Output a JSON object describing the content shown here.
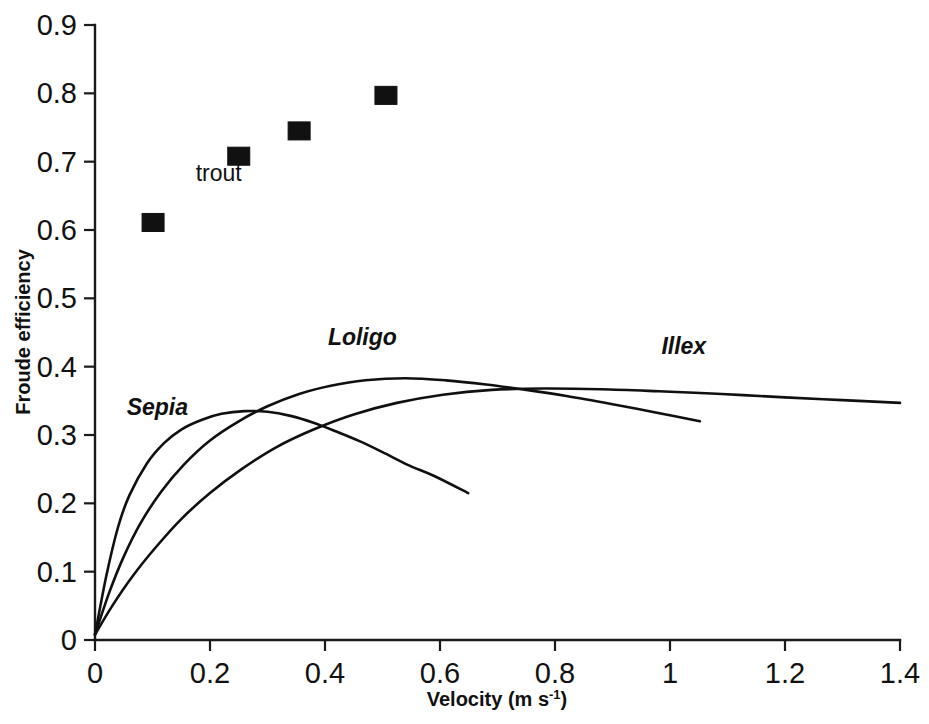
{
  "chart_data": {
    "type": "line",
    "title": "",
    "xlabel": "Velocity (m s-1)",
    "xlabel_base": "Velocity (m s",
    "xlabel_sup": "-1",
    "xlabel_tail": ")",
    "ylabel": "Froude efficiency",
    "xlim": [
      0,
      1.4
    ],
    "ylim": [
      0,
      0.9
    ],
    "xticks": [
      0,
      0.2,
      0.4,
      0.6,
      0.8,
      1,
      1.2,
      1.4
    ],
    "xticklabels": [
      "0",
      "0.2",
      "0.4",
      "0.6",
      "0.8",
      "1",
      "1.2",
      "1.4"
    ],
    "yticks": [
      0,
      0.1,
      0.2,
      0.3,
      0.4,
      0.5,
      0.6,
      0.7,
      0.8,
      0.9
    ],
    "yticklabels": [
      "0",
      "0.1",
      "0.2",
      "0.3",
      "0.4",
      "0.5",
      "0.6",
      "0.7",
      "0.8",
      "0.9"
    ],
    "grid": false,
    "legend_position": "inline-annotations",
    "line_color": "#101010",
    "marker_color": "#111111",
    "series": [
      {
        "name": "trout",
        "label": "trout",
        "type": "scatter",
        "marker": "filled-square",
        "label_x": 0.175,
        "label_y": 0.672,
        "points": [
          {
            "x": 0.101,
            "y": 0.611
          },
          {
            "x": 0.25,
            "y": 0.708
          },
          {
            "x": 0.355,
            "y": 0.745
          },
          {
            "x": 0.506,
            "y": 0.797
          }
        ]
      },
      {
        "name": "Sepia",
        "label": "Sepia",
        "type": "line",
        "label_x": 0.055,
        "label_y": 0.33,
        "values": [
          {
            "x": 0.0,
            "y": 0.008
          },
          {
            "x": 0.02,
            "y": 0.095
          },
          {
            "x": 0.04,
            "y": 0.165
          },
          {
            "x": 0.06,
            "y": 0.212
          },
          {
            "x": 0.09,
            "y": 0.258
          },
          {
            "x": 0.12,
            "y": 0.288
          },
          {
            "x": 0.15,
            "y": 0.308
          },
          {
            "x": 0.185,
            "y": 0.322
          },
          {
            "x": 0.22,
            "y": 0.331
          },
          {
            "x": 0.26,
            "y": 0.335
          },
          {
            "x": 0.3,
            "y": 0.334
          },
          {
            "x": 0.34,
            "y": 0.328
          },
          {
            "x": 0.38,
            "y": 0.318
          },
          {
            "x": 0.42,
            "y": 0.305
          },
          {
            "x": 0.46,
            "y": 0.291
          },
          {
            "x": 0.5,
            "y": 0.275
          },
          {
            "x": 0.545,
            "y": 0.256
          },
          {
            "x": 0.59,
            "y": 0.24
          },
          {
            "x": 0.649,
            "y": 0.215
          }
        ]
      },
      {
        "name": "Loligo",
        "label": "Loligo",
        "type": "line",
        "label_x": 0.405,
        "label_y": 0.432,
        "values": [
          {
            "x": 0.0,
            "y": 0.008
          },
          {
            "x": 0.025,
            "y": 0.07
          },
          {
            "x": 0.05,
            "y": 0.122
          },
          {
            "x": 0.08,
            "y": 0.172
          },
          {
            "x": 0.115,
            "y": 0.217
          },
          {
            "x": 0.155,
            "y": 0.257
          },
          {
            "x": 0.2,
            "y": 0.292
          },
          {
            "x": 0.25,
            "y": 0.32
          },
          {
            "x": 0.3,
            "y": 0.342
          },
          {
            "x": 0.355,
            "y": 0.36
          },
          {
            "x": 0.41,
            "y": 0.372
          },
          {
            "x": 0.47,
            "y": 0.38
          },
          {
            "x": 0.54,
            "y": 0.383
          },
          {
            "x": 0.61,
            "y": 0.38
          },
          {
            "x": 0.68,
            "y": 0.374
          },
          {
            "x": 0.75,
            "y": 0.366
          },
          {
            "x": 0.82,
            "y": 0.357
          },
          {
            "x": 0.9,
            "y": 0.345
          },
          {
            "x": 0.975,
            "y": 0.333
          },
          {
            "x": 1.052,
            "y": 0.32
          }
        ]
      },
      {
        "name": "Illex",
        "label": "Illex",
        "type": "line",
        "label_x": 0.985,
        "label_y": 0.418,
        "values": [
          {
            "x": 0.0,
            "y": 0.008
          },
          {
            "x": 0.03,
            "y": 0.05
          },
          {
            "x": 0.065,
            "y": 0.093
          },
          {
            "x": 0.105,
            "y": 0.135
          },
          {
            "x": 0.15,
            "y": 0.177
          },
          {
            "x": 0.2,
            "y": 0.215
          },
          {
            "x": 0.255,
            "y": 0.25
          },
          {
            "x": 0.315,
            "y": 0.282
          },
          {
            "x": 0.38,
            "y": 0.308
          },
          {
            "x": 0.45,
            "y": 0.33
          },
          {
            "x": 0.525,
            "y": 0.347
          },
          {
            "x": 0.605,
            "y": 0.359
          },
          {
            "x": 0.69,
            "y": 0.366
          },
          {
            "x": 0.78,
            "y": 0.368
          },
          {
            "x": 0.88,
            "y": 0.367
          },
          {
            "x": 0.98,
            "y": 0.364
          },
          {
            "x": 1.09,
            "y": 0.36
          },
          {
            "x": 1.2,
            "y": 0.355
          },
          {
            "x": 1.3,
            "y": 0.351
          },
          {
            "x": 1.4,
            "y": 0.347
          }
        ]
      }
    ]
  }
}
